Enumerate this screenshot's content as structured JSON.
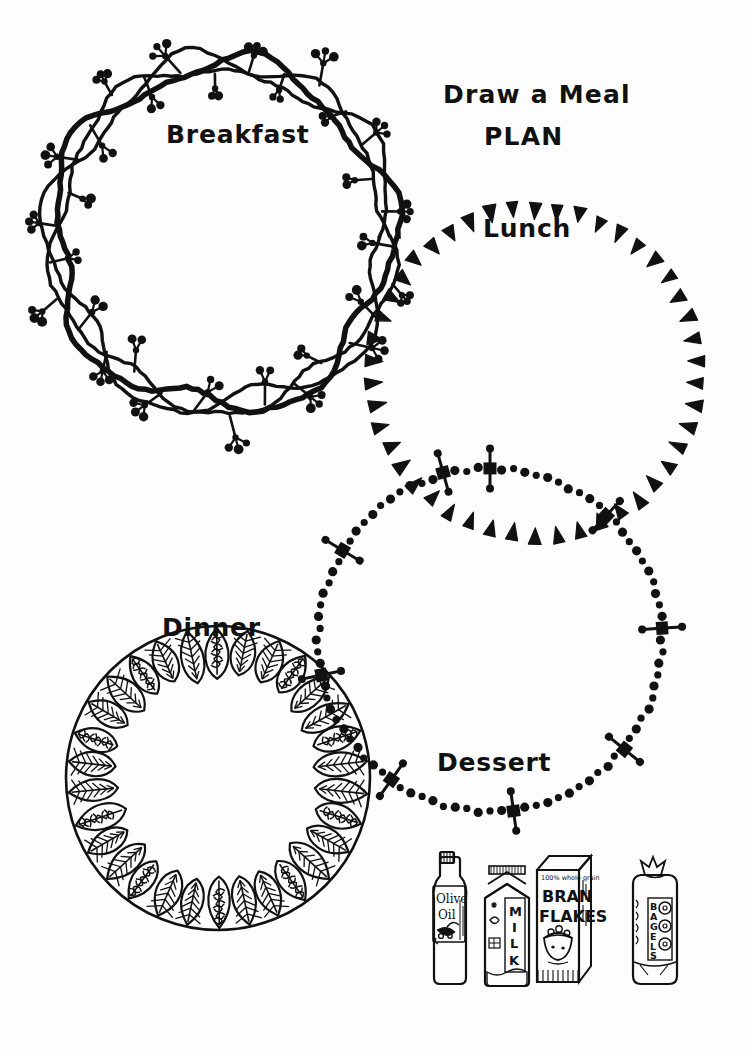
{
  "page": {
    "kind": "worksheet",
    "background_color": "#fdfdfd",
    "ink_color": "#111111",
    "width": 751,
    "height": 1054
  },
  "header": {
    "title_line_1": "Draw a Meal",
    "title_line_2": "PLAN"
  },
  "circles": [
    {
      "id": "breakfast",
      "label": "Breakfast",
      "border_style": "vine-wreath-with-berries",
      "cx": 222,
      "cy": 236,
      "r": 168
    },
    {
      "id": "lunch",
      "label": "Lunch",
      "border_style": "triangle-arrow-chain",
      "cx": 535,
      "cy": 372,
      "r": 162
    },
    {
      "id": "dessert",
      "label": "Dessert",
      "border_style": "beaded-chain-with-square-crosses",
      "cx": 490,
      "cy": 640,
      "r": 172
    },
    {
      "id": "dinner",
      "label": "Dinner",
      "border_style": "leaf-wreath",
      "cx": 218,
      "cy": 778,
      "r": 152
    }
  ],
  "food_illustrations": [
    {
      "id": "olive-oil",
      "name": "olive-oil-bottle",
      "label": "Olive Oil",
      "label_line_1": "Olive",
      "label_line_2": "Oil"
    },
    {
      "id": "milk",
      "name": "milk-carton",
      "label": "MILK",
      "letters": [
        "M",
        "I",
        "L",
        "K"
      ]
    },
    {
      "id": "bran-flakes",
      "name": "bran-flakes-box",
      "label": "BRAN FLAKES",
      "label_line_1": "BRAN",
      "label_line_2": "FLAKES",
      "tagline": "100% whole grain"
    },
    {
      "id": "bagels",
      "name": "bagels-bag",
      "label": "BAGELS",
      "letters": [
        "B",
        "A",
        "G",
        "E",
        "L",
        "S"
      ]
    }
  ]
}
